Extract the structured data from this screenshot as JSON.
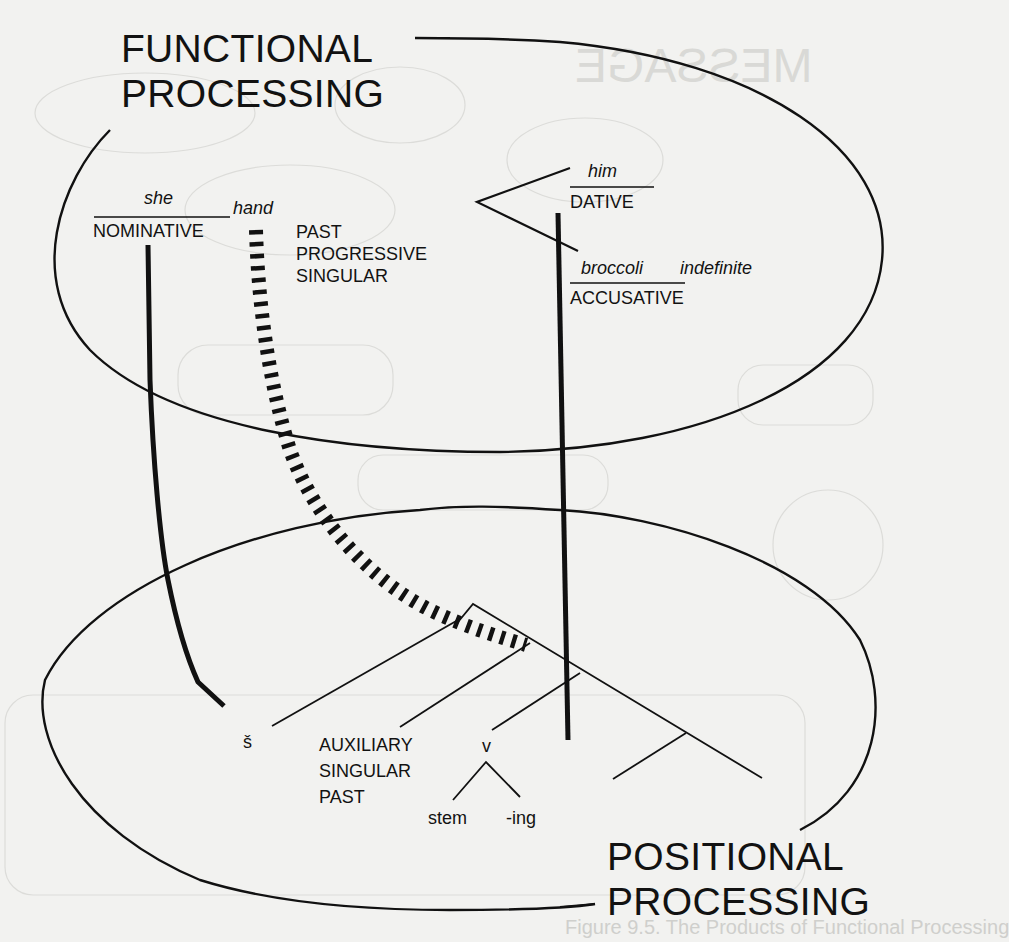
{
  "diagram": {
    "functional": {
      "title_line1": "FUNCTIONAL",
      "title_line2": "PROCESSING",
      "nominative": {
        "word": "she",
        "case": "NOMINATIVE"
      },
      "verb": {
        "word": "hand",
        "features": [
          "PAST",
          "PROGRESSIVE",
          "SINGULAR"
        ]
      },
      "dative": {
        "word": "him",
        "case": "DATIVE"
      },
      "accusative": {
        "word": "broccoli",
        "modifier": "indefinite",
        "case": "ACCUSATIVE"
      }
    },
    "positional": {
      "title_line1": "POSITIONAL",
      "title_line2": "PROCESSING",
      "subject_slot": "š",
      "auxiliary": [
        "AUXILIARY",
        "SINGULAR",
        "PAST"
      ],
      "verb_node": "v",
      "verb_parts": {
        "stem": "stem",
        "suffix": "-ing"
      }
    }
  },
  "bleed_through": {
    "heading": "MESSAGE",
    "caption": "Figure 9.5. The Products of Functional Processing"
  },
  "colors": {
    "ink": "#111111",
    "paper": "#f2f2f0",
    "ghost": "#d9d9d6"
  }
}
